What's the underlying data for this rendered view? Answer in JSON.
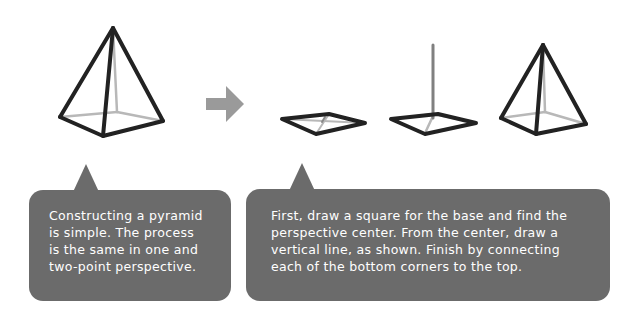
{
  "colors": {
    "bubble_fill": "#6b6b6b",
    "bubble_text": "#ffffff",
    "edge_front": "#222222",
    "edge_hidden": "#b8b8b8",
    "guide_line": "#808080",
    "arrow": "#9a9a9a"
  },
  "figures": [
    {
      "id": "finished-pyramid",
      "description": "Completed pyramid with hidden edges in light gray"
    },
    {
      "id": "step-1-base",
      "description": "Square base in perspective with diagonals to find the center"
    },
    {
      "id": "step-2-vertical",
      "description": "Base with vertical line rising from perspective center"
    },
    {
      "id": "step-3-pyramid",
      "description": "Bottom corners connected to top of vertical line"
    }
  ],
  "arrow": {
    "icon": "right-arrow-icon"
  },
  "callouts": [
    {
      "id": "intro",
      "text": "Constructing a pyramid\nis simple. The process\nis the same in one and\ntwo-point perspective."
    },
    {
      "id": "steps",
      "text": "First, draw a square for the base and find the\nperspective center. From the center, draw a\nvertical line, as shown. Finish by connecting\neach of the bottom corners to the top."
    }
  ]
}
